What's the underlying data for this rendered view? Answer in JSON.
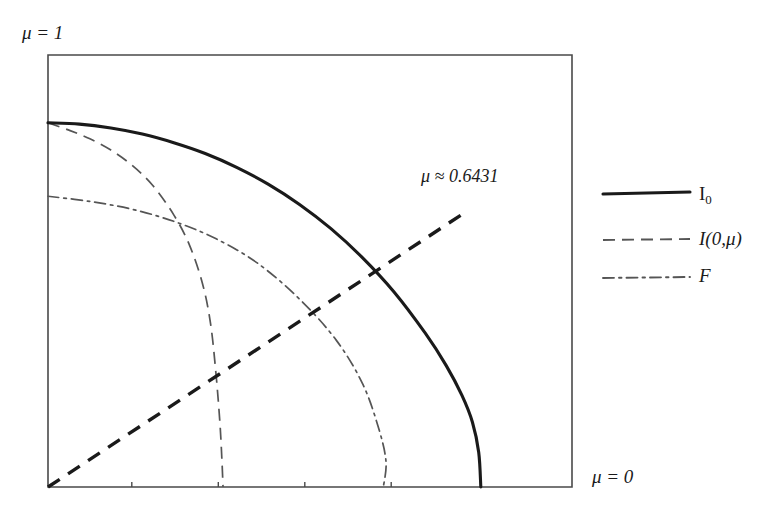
{
  "figure": {
    "background_color": "#ffffff",
    "ink_color": "#1a1a1a",
    "thin_ink_color": "#555555",
    "axis_color": "#4a4a4a"
  },
  "axis_labels": {
    "top_left": "μ = 1",
    "bottom_right": "μ = 0"
  },
  "annotation": {
    "text": "μ ≈ 0.6431",
    "value": 0.6431
  },
  "legend": {
    "position": "right",
    "items": [
      {
        "label": "I₀",
        "style": "solid",
        "width": 3.0,
        "color": "#1a1a1a"
      },
      {
        "label": "I(0,μ)",
        "style": "dashed",
        "width": 1.6,
        "color": "#555555"
      },
      {
        "label": "F",
        "style": "dashdot",
        "width": 1.6,
        "color": "#555555"
      }
    ]
  },
  "chart_data": {
    "type": "line",
    "title": "",
    "xlabel": "μ = 0",
    "ylabel": "μ = 1",
    "grid": false,
    "legend_position": "right",
    "xlim": [
      0,
      1
    ],
    "ylim": [
      0,
      1
    ],
    "x_ticks": [
      0.16,
      0.325,
      0.49,
      0.655
    ],
    "y_ticks": [],
    "annotations": [
      {
        "text": "μ ≈ 0.6431",
        "x": 0.71,
        "y": 0.74
      }
    ],
    "series": [
      {
        "name": "I₀",
        "style": "solid",
        "color": "#1a1a1a",
        "x": [
          0.0,
          0.06,
          0.12,
          0.18,
          0.24,
          0.3,
          0.36,
          0.42,
          0.48,
          0.54,
          0.6,
          0.66,
          0.72,
          0.76,
          0.79,
          0.81,
          0.822,
          0.826
        ],
        "y": [
          0.843,
          0.84,
          0.831,
          0.817,
          0.797,
          0.772,
          0.74,
          0.701,
          0.654,
          0.598,
          0.531,
          0.452,
          0.356,
          0.281,
          0.212,
          0.15,
          0.08,
          0.0
        ]
      },
      {
        "name": "I(0,μ)",
        "style": "dashed",
        "color": "#555555",
        "x": [
          0.0,
          0.04,
          0.08,
          0.12,
          0.16,
          0.2,
          0.24,
          0.27,
          0.295,
          0.31,
          0.32,
          0.328,
          0.332,
          0.334
        ],
        "y": [
          0.843,
          0.826,
          0.806,
          0.78,
          0.745,
          0.698,
          0.63,
          0.56,
          0.47,
          0.38,
          0.27,
          0.15,
          0.06,
          0.0
        ]
      },
      {
        "name": "F",
        "style": "dashdot",
        "color": "#555555",
        "x": [
          0.0,
          0.08,
          0.16,
          0.24,
          0.32,
          0.4,
          0.48,
          0.55,
          0.6,
          0.63,
          0.645,
          0.64
        ],
        "y": [
          0.673,
          0.661,
          0.643,
          0.615,
          0.575,
          0.518,
          0.435,
          0.34,
          0.24,
          0.14,
          0.06,
          0.0
        ]
      },
      {
        "name": "mu-line",
        "style": "thick-dashed",
        "color": "#1a1a1a",
        "x": [
          0.0,
          0.795
        ],
        "y": [
          0.0,
          0.635
        ]
      }
    ]
  }
}
